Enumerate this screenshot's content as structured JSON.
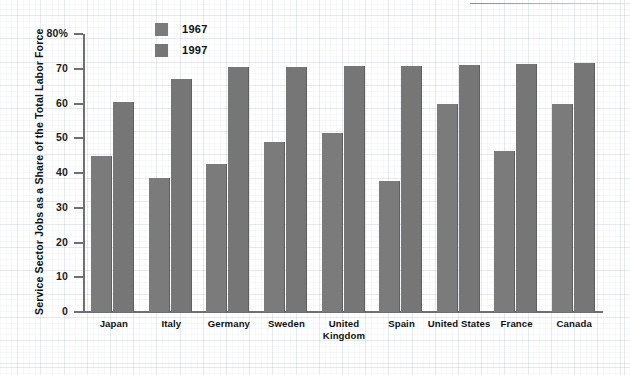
{
  "chart_data": {
    "type": "bar",
    "title": "",
    "xlabel": "",
    "ylabel": "Service Sector Jobs as a Share of the Total Labor Force",
    "ylim": [
      0,
      80
    ],
    "ytick_labels": [
      "80%",
      "70",
      "60",
      "50",
      "40",
      "30",
      "20",
      "10",
      "0"
    ],
    "yticks": [
      80,
      70,
      60,
      50,
      40,
      30,
      20,
      10,
      0
    ],
    "grid": true,
    "legend_position": "top-center",
    "categories": [
      "Japan",
      "Italy",
      "Germany",
      "Sweden",
      "United Kingdom",
      "Spain",
      "United States",
      "France",
      "Canada"
    ],
    "series": [
      {
        "name": "1967",
        "color": "#7b7b7b",
        "values": [
          45,
          38.5,
          42.5,
          49,
          51.5,
          37.8,
          60,
          46.3,
          60
        ]
      },
      {
        "name": "1997",
        "color": "#767676",
        "values": [
          60.3,
          67,
          70.5,
          70.5,
          70.8,
          70.9,
          71.2,
          71.3,
          71.6
        ]
      }
    ]
  },
  "legend": {
    "items": [
      {
        "label": "1967"
      },
      {
        "label": "1997"
      }
    ]
  },
  "axis": {
    "y_title": "Service Sector Jobs as a Share of the Total Labor Force"
  }
}
